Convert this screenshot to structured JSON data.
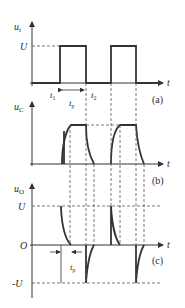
{
  "figure": {
    "panels": [
      {
        "id": "a",
        "caption": "(a)",
        "y_label_main": "u",
        "y_label_sub": "i",
        "x_label": "t",
        "level_labels": [
          "U"
        ],
        "time_labels": {
          "t1_main": "t",
          "t1_sub": "1",
          "t2_main": "t",
          "t2_sub": "2",
          "tp_main": "t",
          "tp_sub": "p"
        }
      },
      {
        "id": "b",
        "caption": "(b)",
        "y_label_main": "u",
        "y_label_sub": "C",
        "x_label": "t"
      },
      {
        "id": "c",
        "caption": "(c)",
        "y_label_main": "u",
        "y_label_sub": "O",
        "x_label": "t",
        "level_labels": [
          "U",
          "O",
          "-U"
        ],
        "time_labels": {
          "tp_main": "t",
          "tp_sub": "p"
        }
      }
    ],
    "colors": {
      "line": "#333333",
      "background": "#ffffff"
    }
  }
}
